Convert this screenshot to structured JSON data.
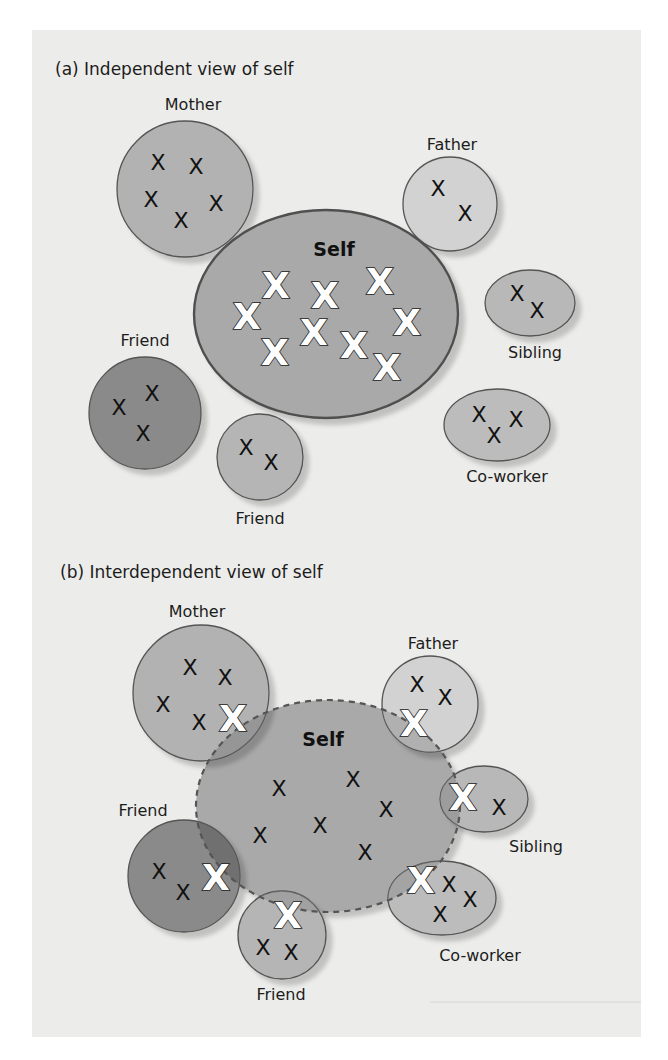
{
  "colors": {
    "panel_bg": "#ececea",
    "self_fill": "#a9a9a9",
    "mother_fill": "#b2b2b2",
    "father_fill": "#d2d2d2",
    "friend_dark_fill": "#8a8a8a",
    "friend_small_fill": "#b5b5b5",
    "sibling_fill": "#b8b8b8",
    "coworker_fill": "#bcbcbc",
    "outline": "#555555",
    "self_outline_b": "#555555"
  },
  "panel_a": {
    "title": "(a) Independent view of self",
    "self_label": "Self",
    "labels": {
      "mother": "Mother",
      "father": "Father",
      "sibling": "Sibling",
      "friend_left": "Friend",
      "friend_bottom": "Friend",
      "coworker": "Co-worker"
    },
    "marker": "X",
    "self_markers_count": 10,
    "mother_markers_count": 5,
    "father_markers_count": 2,
    "sibling_markers_count": 2,
    "friend_left_markers_count": 3,
    "friend_bottom_markers_count": 2,
    "coworker_markers_count": 3
  },
  "panel_b": {
    "title": "(b) Interdependent view of self",
    "self_label": "Self",
    "labels": {
      "mother": "Mother",
      "father": "Father",
      "sibling": "Sibling",
      "friend_left": "Friend",
      "friend_bottom": "Friend",
      "coworker": "Co-worker"
    },
    "marker": "X",
    "self_markers_count": 7,
    "shared_markers_count": 6
  }
}
